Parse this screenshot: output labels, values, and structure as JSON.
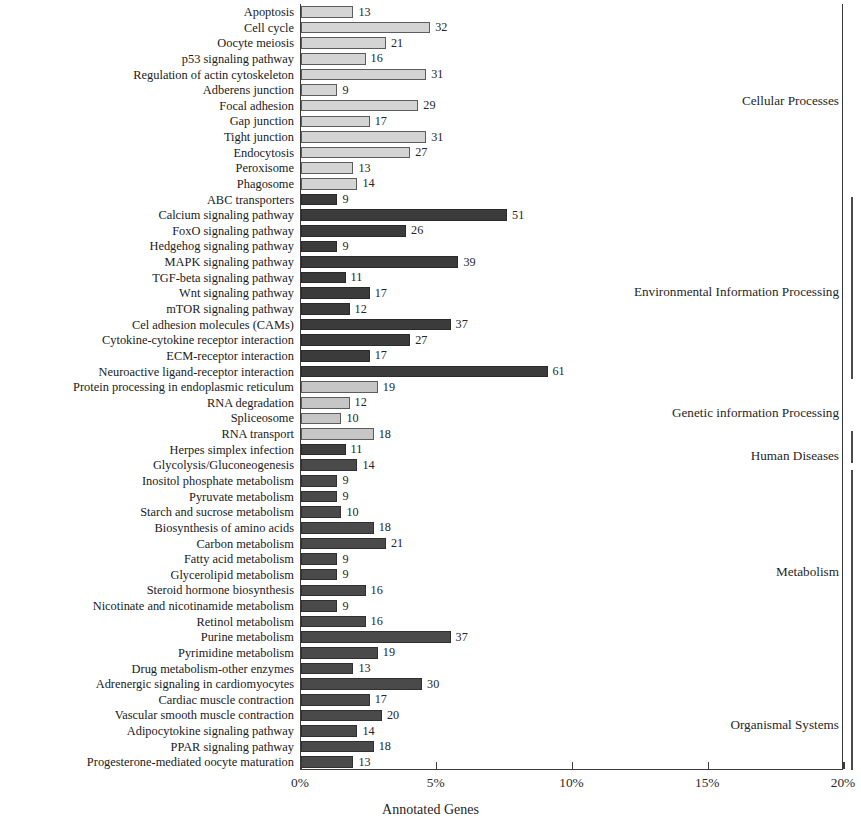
{
  "chart_data": {
    "type": "bar",
    "orientation": "horizontal",
    "title": "",
    "xlabel": "Annotated Genes",
    "ylabel": "",
    "xlim": [
      0,
      20
    ],
    "xunit": "%",
    "xticks": [
      "0%",
      "5%",
      "10%",
      "15%",
      "20%"
    ],
    "xtick_values": [
      0,
      5,
      10,
      15,
      20
    ],
    "grid": false,
    "legend_position": "right-side group brackets",
    "total_annotated_genes": 672,
    "categories": [
      "Apoptosis",
      "Cell cycle",
      "Oocyte meiosis",
      "p53 signaling pathway",
      "Regulation of actin cytoskeleton",
      "Adberens junction",
      "Focal adhesion",
      "Gap junction",
      "Tight junction",
      "Endocytosis",
      "Peroxisome",
      "Phagosome",
      "ABC transporters",
      "Calcium signaling pathway",
      "FoxO signaling pathway",
      "Hedgehog signaling pathway",
      "MAPK signaling pathway",
      "TGF-beta signaling pathway",
      "Wnt signaling pathway",
      "mTOR signaling pathway",
      "Cel adhesion molecules (CAMs)",
      "Cytokine-cytokine receptor interaction",
      "ECM-receptor interaction",
      "Neuroactive ligand-receptor interaction",
      "Protein processing in endoplasmic reticulum",
      "RNA degradation",
      "Spliceosome",
      "RNA transport",
      "Herpes simplex infection",
      "Glycolysis/Gluconeogenesis",
      "Inositol phosphate metabolism",
      "Pyruvate metabolism",
      "Starch and sucrose metabolism",
      "Biosynthesis of amino acids",
      "Carbon metabolism",
      "Fatty acid metabolism",
      "Glycerolipid metabolism",
      "Steroid hormone biosynthesis",
      "Nicotinate and nicotinamide metabolism",
      "Retinol metabolism",
      "Purine metabolism",
      "Pyrimidine metabolism",
      "Drug metabolism-other enzymes",
      "Adrenergic signaling in cardiomyocytes",
      "Cardiac muscle contraction",
      "Vascular smooth muscle contraction",
      "Adipocytokine signaling pathway",
      "PPAR signaling pathway",
      "Progesterone-mediated oocyte maturation"
    ],
    "values": [
      13,
      32,
      21,
      16,
      31,
      9,
      29,
      17,
      31,
      27,
      13,
      14,
      9,
      51,
      26,
      9,
      39,
      11,
      17,
      12,
      37,
      27,
      17,
      61,
      19,
      12,
      10,
      18,
      11,
      14,
      9,
      9,
      10,
      18,
      21,
      9,
      9,
      16,
      9,
      16,
      37,
      19,
      13,
      30,
      17,
      20,
      14,
      18,
      13
    ],
    "percents": [
      1.93,
      4.76,
      3.13,
      2.38,
      4.61,
      1.34,
      4.32,
      2.53,
      4.61,
      4.02,
      1.93,
      2.08,
      1.34,
      7.59,
      3.87,
      1.34,
      5.8,
      1.64,
      2.53,
      1.79,
      5.51,
      4.02,
      2.53,
      9.08,
      2.83,
      1.79,
      1.49,
      2.68,
      1.64,
      2.08,
      1.34,
      1.34,
      1.49,
      2.68,
      3.13,
      1.34,
      1.34,
      2.38,
      1.34,
      2.38,
      5.51,
      2.83,
      1.93,
      4.46,
      2.53,
      2.98,
      2.08,
      2.68,
      1.93
    ],
    "groups": [
      {
        "name": "Cellular Processes",
        "color": "#d4d4d4",
        "start_index": 0,
        "end_index": 11,
        "label_top": 93
      },
      {
        "name": "Environmental Information Processing",
        "color": "#3b3b3b",
        "start_index": 12,
        "end_index": 23,
        "label_top": 284
      },
      {
        "name": "Genetic information Processing",
        "color": "#c6c6c6",
        "start_index": 24,
        "end_index": 27,
        "label_top": 405
      },
      {
        "name": "Human Diseases",
        "color": "#3f3f3f",
        "start_index": 28,
        "end_index": 28,
        "label_top": 448
      },
      {
        "name": "Metabolism",
        "color": "#4a4a4a",
        "start_index": 29,
        "end_index": 42,
        "label_top": 564
      },
      {
        "name": "Organismal Systems",
        "color": "#4a4a4a",
        "start_index": 43,
        "end_index": 48,
        "label_top": 717
      }
    ],
    "brackets": [
      {
        "name": "Environmental Information Processing",
        "top": 197,
        "height": 182
      },
      {
        "name": "Human Diseases",
        "top": 431,
        "height": 32
      },
      {
        "name": "Metabolism-Organismal",
        "top": 470,
        "height": 300
      }
    ]
  },
  "colors": {
    "axis": "#3a3a3a",
    "text": "#1a1a1a",
    "background": "#ffffff",
    "light_bar": "#d4d4d4",
    "dark_bar": "#3b3b3b"
  }
}
